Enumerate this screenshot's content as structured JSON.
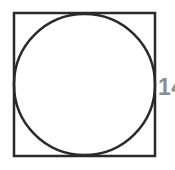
{
  "diagram": {
    "type": "circle-inscribed-in-square",
    "label": "14",
    "colors": {
      "background": "#ffffff",
      "shape_stroke": "#2a2a2a",
      "label_color": "#8d8d8d"
    }
  }
}
